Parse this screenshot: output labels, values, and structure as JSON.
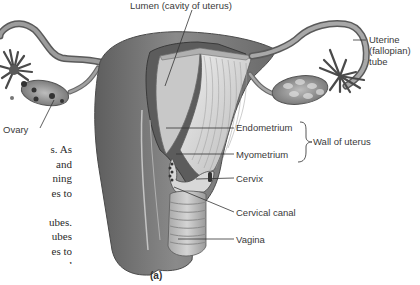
{
  "figure": {
    "caption": "(a)"
  },
  "labels": {
    "lumen": "Lumen (cavity of uterus)",
    "uterine_tube_line1": "Uterine",
    "uterine_tube_line2": "(fallopian) tube",
    "ovary": "Ovary",
    "endometrium": "Endometrium",
    "myometrium": "Myometrium",
    "wall_of_uterus": "Wall of uterus",
    "cervix": "Cervix",
    "cervical_canal": "Cervical canal",
    "vagina": "Vagina"
  },
  "body_text_fragments": [
    "s. As",
    "and",
    "ning",
    "es to",
    "",
    "ubes.",
    "ubes",
    "es to",
    "and"
  ],
  "colors": {
    "background": "#ffffff",
    "tissue_dark": "#6e6e6e",
    "tissue_mid": "#9a9a9a",
    "tissue_light": "#d2d2d2",
    "leader_line": "#333333",
    "label_text": "#3a3a3a"
  }
}
